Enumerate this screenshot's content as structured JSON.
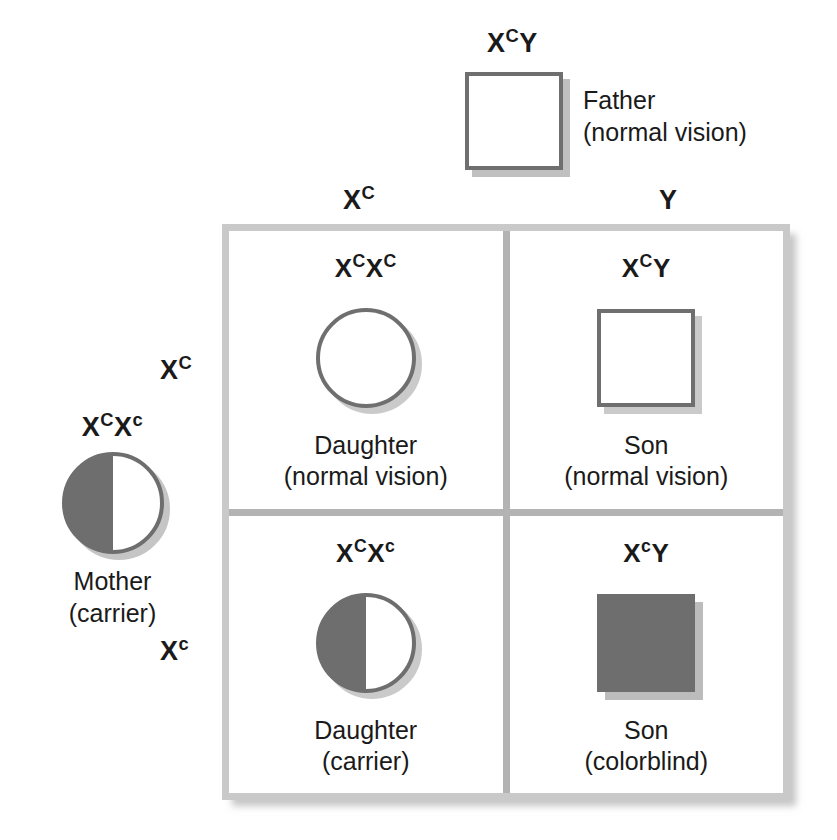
{
  "diagram": {
    "colors": {
      "fill_gray": "#6e6e6e",
      "outline_gray": "#6f6f6f",
      "shadow_gray": "#969696",
      "grid_border": "#c9c9c9",
      "text": "#1a1a1a"
    }
  },
  "father": {
    "genotype": {
      "allele1": "X",
      "sup1": "C",
      "allele2": "Y",
      "sup2": ""
    },
    "genotype_text": "XᶜY",
    "label_line1": "Father",
    "label_line2": "(normal vision)",
    "symbol": "open-square",
    "sex": "male",
    "phenotype": "normal vision"
  },
  "mother": {
    "genotype": {
      "allele1": "X",
      "sup1": "C",
      "allele2": "X",
      "sup2": "c"
    },
    "genotype_text": "XᶜXᶜ",
    "label_line1": "Mother",
    "label_line2": "(carrier)",
    "symbol": "half-filled-circle",
    "sex": "female",
    "phenotype": "carrier"
  },
  "column_headers": [
    {
      "allele": "X",
      "sup": "C"
    },
    {
      "allele": "Y",
      "sup": ""
    }
  ],
  "row_headers": [
    {
      "allele": "X",
      "sup": "C"
    },
    {
      "allele": "X",
      "sup": "c"
    }
  ],
  "cells": [
    {
      "position": "top-left",
      "genotype": {
        "a1": "X",
        "s1": "C",
        "a2": "X",
        "s2": "C"
      },
      "genotype_text": "XᶜXᶜ",
      "label_line1": "Daughter",
      "label_line2": "(normal vision)",
      "symbol": "open-circle",
      "sex": "female",
      "phenotype": "normal vision"
    },
    {
      "position": "top-right",
      "genotype": {
        "a1": "X",
        "s1": "C",
        "a2": "Y",
        "s2": ""
      },
      "genotype_text": "XᶜY",
      "label_line1": "Son",
      "label_line2": "(normal vision)",
      "symbol": "open-square",
      "sex": "male",
      "phenotype": "normal vision"
    },
    {
      "position": "bottom-left",
      "genotype": {
        "a1": "X",
        "s1": "C",
        "a2": "X",
        "s2": "c"
      },
      "genotype_text": "XᶜXᶜ",
      "label_line1": "Daughter",
      "label_line2": "(carrier)",
      "symbol": "half-filled-circle",
      "sex": "female",
      "phenotype": "carrier"
    },
    {
      "position": "bottom-right",
      "genotype": {
        "a1": "X",
        "s1": "c",
        "a2": "Y",
        "s2": ""
      },
      "genotype_text": "XᶜY",
      "label_line1": "Son",
      "label_line2": "(colorblind)",
      "symbol": "filled-square",
      "sex": "male",
      "phenotype": "colorblind"
    }
  ]
}
